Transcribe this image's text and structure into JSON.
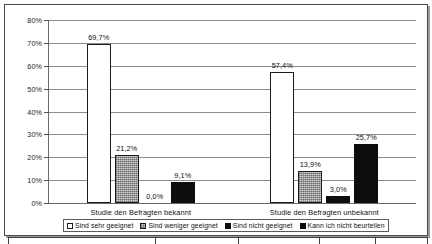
{
  "chart_data": {
    "type": "bar",
    "title": "",
    "xlabel": "",
    "ylabel": "",
    "ylim": [
      0,
      80
    ],
    "yticks": [
      "0%",
      "10%",
      "20%",
      "30%",
      "40%",
      "50%",
      "60%",
      "70%",
      "80%"
    ],
    "ytick_values": [
      0,
      10,
      20,
      30,
      40,
      50,
      60,
      70,
      80
    ],
    "grid": true,
    "legend_position": "bottom",
    "categories": [
      "Studie den Befragten bekannt",
      "Studie den Befragten unbekannt"
    ],
    "series": [
      {
        "name": "Sind sehr geeignet",
        "values": [
          69.7,
          57.4
        ],
        "labels": [
          "69,7%",
          "57,4%"
        ],
        "color": "#ffffff",
        "pattern": "solid-outline"
      },
      {
        "name": "Sind weniger geeignet",
        "values": [
          21.2,
          13.9
        ],
        "labels": [
          "21,2%",
          "13,9%"
        ],
        "color": "#d2d2d2",
        "pattern": "stipple"
      },
      {
        "name": "Sind nicht geeignet",
        "values": [
          0.0,
          3.0
        ],
        "labels": [
          "0,0%",
          "3,0%"
        ],
        "color": "#0d0d0d",
        "pattern": "solid"
      },
      {
        "name": "Kann ich nicht beurteilen",
        "values": [
          9.1,
          25.7
        ],
        "labels": [
          "9,1%",
          "25,7%"
        ],
        "color": "#0d0d0d",
        "pattern": "solid"
      }
    ]
  },
  "legend": {
    "items": [
      {
        "label": "Sind sehr geeignet"
      },
      {
        "label": "Sind weniger geeignet"
      },
      {
        "label": "Sind nicht geeignet"
      },
      {
        "label": "Kann ich nicht beurteilen"
      }
    ]
  }
}
